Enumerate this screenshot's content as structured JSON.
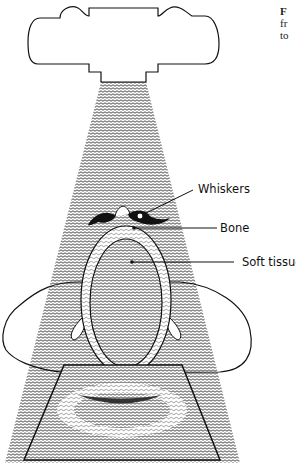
{
  "figure": {
    "caption_fragments": [
      "F",
      "fr",
      "to"
    ],
    "labels": {
      "whiskers": "Whiskers",
      "bone": "Bone",
      "soft_tissue": "Soft tissue"
    },
    "parts": [
      "x-ray-tube",
      "x-ray-beam",
      "head-cross-section",
      "whiskers",
      "bone-ring",
      "soft-tissue",
      "film-plate"
    ],
    "colors": {
      "line": "#111111",
      "background": "#ffffff",
      "beam": "#555555"
    }
  }
}
